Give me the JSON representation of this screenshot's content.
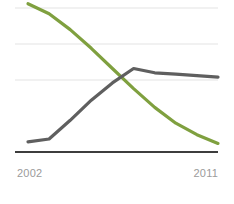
{
  "chart_data": {
    "type": "line",
    "title": "",
    "subtitle": "",
    "xlabel": "",
    "ylabel": "",
    "x": [
      2002,
      2003,
      2004,
      2005,
      2006,
      2007,
      2008,
      2009,
      2010,
      2011
    ],
    "tick_labels": [
      "2002",
      "2011"
    ],
    "xlim": [
      2002,
      2011
    ],
    "ylim": [
      0,
      100
    ],
    "grid": true,
    "gridlines": [
      25,
      50,
      75,
      100
    ],
    "legend": "none",
    "series": [
      {
        "name": "declining-series",
        "color": "#7fa03f",
        "values": [
          103,
          96,
          85,
          72,
          58,
          44,
          31,
          20,
          12,
          6
        ]
      },
      {
        "name": "rising-series",
        "color": "#5f5f5f",
        "values": [
          7,
          9,
          22,
          36,
          48,
          58,
          55,
          54,
          53,
          52
        ]
      }
    ],
    "crossing_point": {
      "x": 2006.3,
      "y": 49
    },
    "annotations": []
  },
  "axis": {
    "left_tick": "2002",
    "right_tick": "2011",
    "tick_color": "#9b9b9b",
    "baseline_color": "#3d3d3d",
    "gridline_color": "#ececec"
  },
  "colors": {
    "background": "#ffffff",
    "series_green": "#7fa03f",
    "series_gray": "#5f5f5f"
  }
}
